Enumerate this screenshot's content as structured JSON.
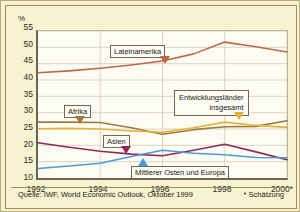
{
  "chart_data": {
    "type": "line",
    "title": "",
    "xlabel": "",
    "ylabel": "%",
    "ylim": [
      10,
      55
    ],
    "yticks": [
      10,
      15,
      20,
      25,
      30,
      35,
      40,
      45,
      50,
      55
    ],
    "xlim": [
      1992,
      2000
    ],
    "x": [
      1992,
      1993,
      1994,
      1995,
      1996,
      1997,
      1998,
      1999,
      2000
    ],
    "xtick_labels": [
      "1992",
      "1994",
      "1996",
      "1998",
      "2000*"
    ],
    "xtick_values": [
      1992,
      1994,
      1996,
      1998,
      2000
    ],
    "grid": true,
    "legend_position": "inline-callouts",
    "series": [
      {
        "name": "Lateinamerika",
        "color": "#c0674b",
        "values": [
          42.2,
          42.8,
          43.6,
          44.6,
          45.8,
          48.0,
          51.6,
          50.2,
          48.6
        ]
      },
      {
        "name": "Afrika",
        "color": "#a07a3c",
        "values": [
          27.1,
          27.1,
          27.0,
          25.4,
          23.4,
          24.8,
          25.7,
          25.8,
          27.5
        ]
      },
      {
        "name": "Entwicklungsländer insgesamt",
        "color": "#e0b436",
        "values": [
          25.1,
          25.2,
          25.0,
          24.4,
          24.0,
          25.4,
          27.1,
          26.1,
          25.5
        ]
      },
      {
        "name": "Asien",
        "color": "#8e2a55",
        "values": [
          20.8,
          19.4,
          18.2,
          17.3,
          16.8,
          18.5,
          20.3,
          18.0,
          15.6
        ]
      },
      {
        "name": "Mittlerer Osten und Europa",
        "color": "#4f9ad6",
        "values": [
          12.9,
          13.7,
          14.5,
          16.6,
          18.5,
          17.6,
          17.1,
          16.3,
          16.2
        ]
      }
    ],
    "annotations": [
      {
        "key": "lateinamerika",
        "text": "Lateinamerika",
        "points_to": "Lateinamerika"
      },
      {
        "key": "afrika",
        "text": "Afrika",
        "points_to": "Afrika"
      },
      {
        "key": "entwicklung",
        "line1": "Entwicklungsländer",
        "line2": "insgesamt",
        "points_to": "Entwicklungsländer insgesamt"
      },
      {
        "key": "asien",
        "text": "Asien",
        "points_to": "Asien"
      },
      {
        "key": "mittlerer",
        "text": "Mittlerer Osten und Europa",
        "points_to": "Mittlerer Osten und Europa"
      }
    ]
  },
  "axis": {
    "unit_label": "%",
    "y": {
      "t55": "55",
      "t50": "50",
      "t45": "45",
      "t40": "40",
      "t35": "35",
      "t30": "30",
      "t25": "25",
      "t20": "20",
      "t15": "15",
      "t10": "10"
    },
    "x": {
      "x1992": "1992",
      "x1994": "1994",
      "x1996": "1996",
      "x1998": "1998",
      "x2000": "2000*"
    }
  },
  "labels": {
    "lateinamerika": "Lateinamerika",
    "afrika": "Afrika",
    "entwicklung_line1": "Entwicklungsländer",
    "entwicklung_line2": "insgesamt",
    "asien": "Asien",
    "mittlerer_osten": "Mittlerer Osten und Europa"
  },
  "footer": {
    "source": "Quelle: IWF, World Economic Outlook, Oktober 1999",
    "note": "* Schätzung"
  },
  "colors": {
    "background": "#f7f2cf",
    "plot_background": "#fdfcf3",
    "border": "#9a8f5c",
    "axis": "#6b6550",
    "grid": "#c9c4ad",
    "lateinamerika": "#c0674b",
    "afrika": "#a07a3c",
    "entwicklungslaender": "#e0b436",
    "asien": "#8e2a55",
    "mittlerer_osten": "#4f9ad6"
  }
}
